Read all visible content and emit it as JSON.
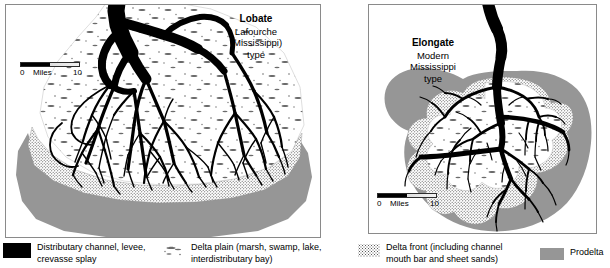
{
  "figure": {
    "type": "geology-diagram",
    "panels": [
      {
        "id": "lobate",
        "title_main": "Lobate",
        "title_line2": "Lafourche",
        "title_line3": "(Mississippi)",
        "title_line4": "type",
        "scale": {
          "zero": "0",
          "unit": "Miles",
          "max": "10"
        }
      },
      {
        "id": "elongate",
        "title_main": "Elongate",
        "title_line2": "Modern",
        "title_line3": "Mississippi",
        "title_line4": "type",
        "scale": {
          "zero": "0",
          "unit": "Miles",
          "max": "10"
        }
      }
    ]
  },
  "legend": {
    "items": [
      {
        "key": "distributary-channel",
        "symbol": "solid-black-block",
        "line1": "Distributary channel, levee,",
        "line2": "crevasse splay",
        "color": "#000000"
      },
      {
        "key": "delta-plain",
        "symbol": "sparse-marsh-tufts",
        "line1": "Delta plain (marsh, swamp, lake,",
        "line2": "interdistributary bay)",
        "color": "#707070"
      },
      {
        "key": "delta-front",
        "symbol": "stipple-dots",
        "line1": "Delta front (including channel",
        "line2": "mouth bar and sheet sands)",
        "color": "#5a5a5a"
      },
      {
        "key": "prodelta",
        "symbol": "solid-gray-block",
        "line1": "Prodelta",
        "line2": "",
        "color": "#969696"
      }
    ]
  },
  "colors": {
    "prodelta_gray": "#969696",
    "channel_black": "#000000",
    "delta_front_stipple": "#5a5a5a",
    "panel_border": "#8a8a8a",
    "background": "#ffffff"
  }
}
